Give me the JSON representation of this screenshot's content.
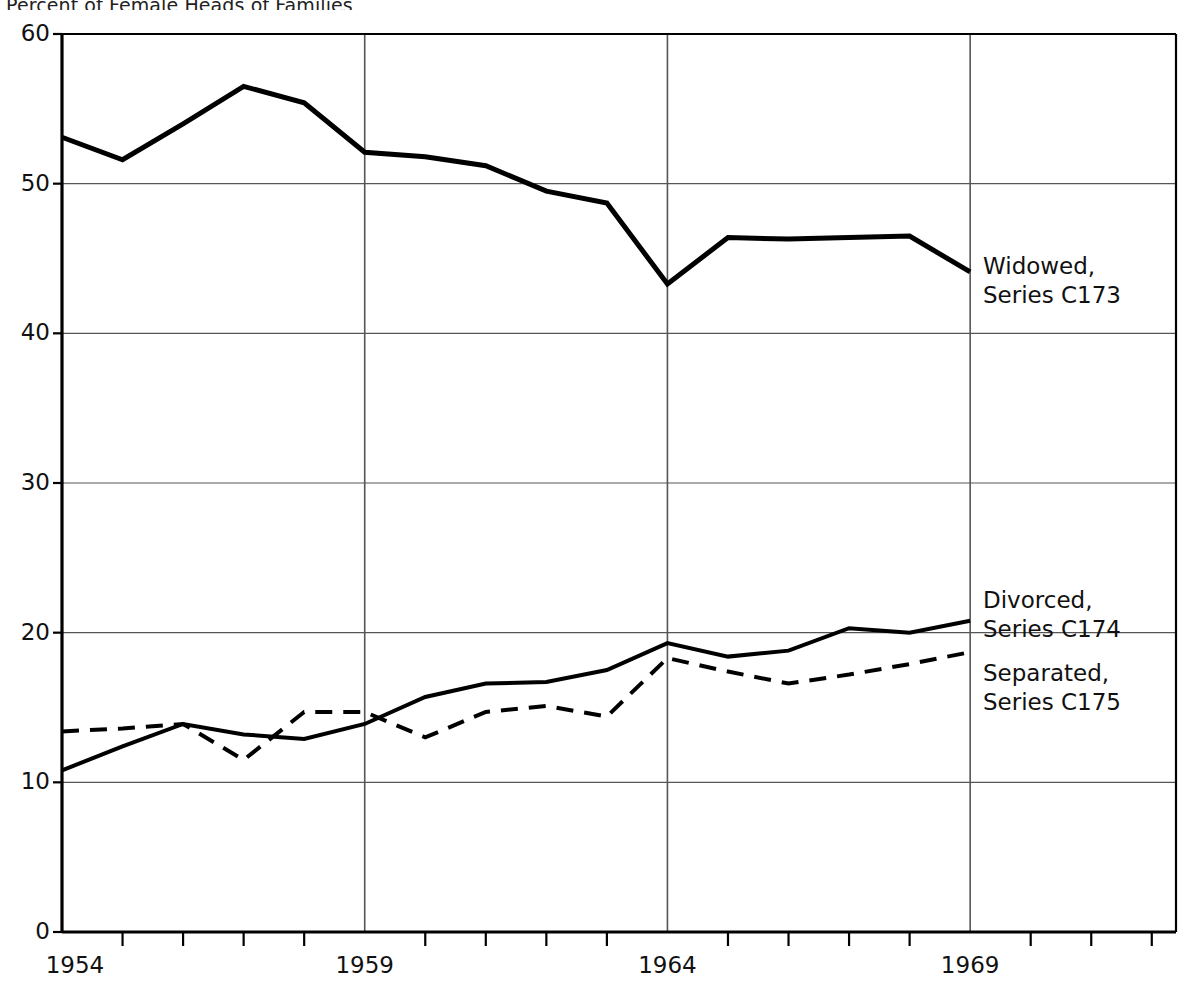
{
  "chart_data": {
    "type": "line",
    "title": "Percent of Female Heads of Families",
    "xlabel": "",
    "ylabel": "",
    "xlim": [
      1954,
      1972.4
    ],
    "ylim": [
      0,
      60
    ],
    "ytick_values": [
      0,
      10,
      20,
      30,
      40,
      50,
      60
    ],
    "ytick_labels": [
      "0",
      "10",
      "20",
      "30",
      "40",
      "50",
      "60"
    ],
    "xtick_values": [
      1954,
      1959,
      1964,
      1969
    ],
    "xtick_labels": [
      "1954",
      "1959",
      "1964",
      "1969"
    ],
    "x_minor_ticks_every": 1,
    "grid": "major-horizontal-and-vertical",
    "legend_position": "inline-right",
    "x": [
      1954,
      1955,
      1956,
      1957,
      1958,
      1959,
      1960,
      1961,
      1962,
      1963,
      1964,
      1965,
      1966,
      1967,
      1968,
      1969
    ],
    "series": [
      {
        "name": "Widowed, Series C173",
        "label_line1": "Widowed,",
        "label_line2": "Series C173",
        "style": "solid",
        "width": 5,
        "color": "#000000",
        "values": [
          53.1,
          51.6,
          54.0,
          56.5,
          55.4,
          52.1,
          51.8,
          51.2,
          49.5,
          48.7,
          43.3,
          46.4,
          46.3,
          46.4,
          46.5,
          44.1
        ]
      },
      {
        "name": "Divorced, Series C174",
        "label_line1": "Divorced,",
        "label_line2": "Series C174",
        "style": "solid",
        "width": 4,
        "color": "#000000",
        "values": [
          10.8,
          12.4,
          13.9,
          13.2,
          12.9,
          13.9,
          15.7,
          16.6,
          16.7,
          17.5,
          19.3,
          18.4,
          18.8,
          20.3,
          20.0,
          20.8
        ]
      },
      {
        "name": "Separated, Series C175",
        "label_line1": "Separated,",
        "label_line2": "Series C175",
        "style": "dashed",
        "width": 4,
        "color": "#000000",
        "values": [
          13.4,
          13.6,
          13.9,
          11.5,
          14.7,
          14.7,
          13.0,
          14.7,
          15.1,
          14.4,
          18.3,
          17.4,
          16.6,
          17.2,
          17.9,
          18.7
        ]
      }
    ]
  },
  "axes": {
    "y_labels": [
      "60",
      "50",
      "40",
      "30",
      "20",
      "10",
      "0"
    ],
    "x_labels": [
      "1954",
      "1959",
      "1964",
      "1969"
    ]
  },
  "labels": {
    "widowed_l1": "Widowed,",
    "widowed_l2": "Series C173",
    "divorced_l1": "Divorced,",
    "divorced_l2": "Series C174",
    "separated_l1": "Separated,",
    "separated_l2": "Series C175"
  },
  "title": {
    "text": "Percent of Female Heads of Families"
  },
  "colors": {
    "ink": "#000000",
    "grid": "#555555",
    "background": "#ffffff"
  }
}
